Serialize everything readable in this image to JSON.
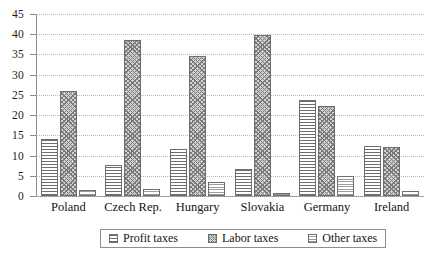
{
  "chart_data": {
    "type": "bar",
    "title": "",
    "subtitle": "",
    "xlabel": "",
    "ylabel": "",
    "ylim": [
      0,
      45
    ],
    "ytick_step": 5,
    "yticks": [
      0,
      5,
      10,
      15,
      20,
      25,
      30,
      35,
      40,
      45
    ],
    "grid": true,
    "grid_axis": "y",
    "grid_style": "dotted",
    "legend_position": "bottom-center",
    "categories": [
      "Poland",
      "Czech Rep.",
      "Hungary",
      "Slovakia",
      "Germany",
      "Ireland"
    ],
    "series": [
      {
        "name": "Profit taxes",
        "pattern": "horizontal-lines",
        "values": [
          14.2,
          7.6,
          11.7,
          6.8,
          23.8,
          12.3
        ]
      },
      {
        "name": "Labor taxes",
        "pattern": "crosshatch",
        "values": [
          26.0,
          38.5,
          34.5,
          39.8,
          22.3,
          12.1
        ]
      },
      {
        "name": "Other taxes",
        "pattern": "fine-horizontal-lines",
        "values": [
          1.6,
          1.8,
          3.5,
          0.7,
          4.9,
          1.3
        ]
      }
    ]
  },
  "colors": {
    "background": "#ffffff",
    "axis": "#8a8a8a",
    "gridline": "#b9b9b9",
    "bar_outline": "#6e6e6e",
    "text": "#151515",
    "legend_border": "#8e8e8e"
  }
}
